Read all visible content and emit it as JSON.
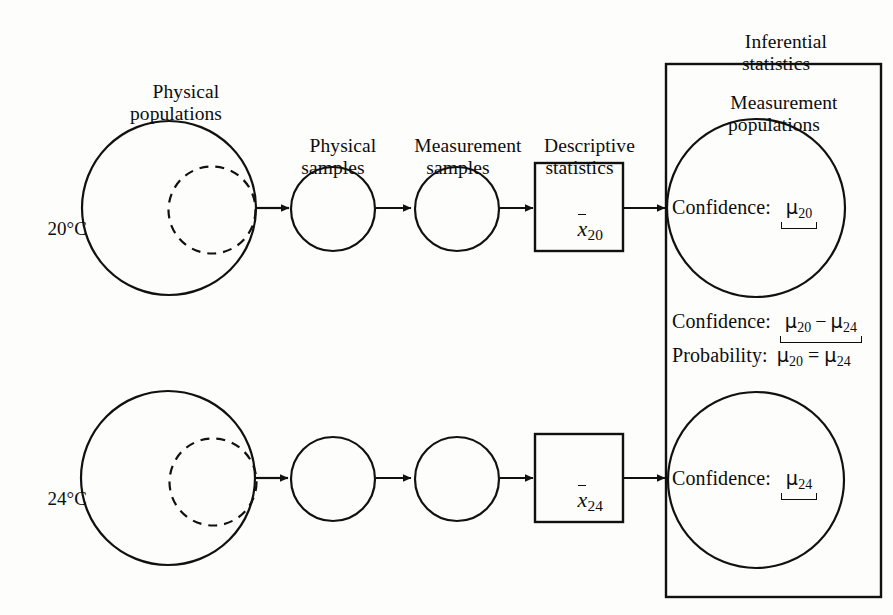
{
  "diagram": {
    "stroke_color": "#111111",
    "background_color": "#fdfdfb",
    "headings": {
      "physical_populations": "Physical\npopulations",
      "physical_samples": "Physical\nsamples",
      "measurement_samples": "Measurement\nsamples",
      "descriptive_statistics": "Descriptive\nstatistics",
      "inferential_statistics": "Inferential\nstatistics",
      "measurement_populations": "Measurement\npopulations"
    },
    "rows": [
      {
        "id": "row-20",
        "temperature_label": "20°C",
        "descriptive_statistic": {
          "symbol": "x",
          "bar": true,
          "subscript": "20"
        },
        "confidence": {
          "label": "Confidence:",
          "expression_mu": "μ",
          "expression_sub": "20"
        }
      },
      {
        "id": "row-24",
        "temperature_label": "24°C",
        "descriptive_statistic": {
          "symbol": "x",
          "bar": true,
          "subscript": "24"
        },
        "confidence": {
          "label": "Confidence:",
          "expression_mu": "μ",
          "expression_sub": "24"
        }
      }
    ],
    "comparisons": [
      {
        "id": "confidence-difference",
        "label": "Confidence:",
        "expr_a_mu": "μ",
        "expr_a_sub": "20",
        "operator": "−",
        "expr_b_mu": "μ",
        "expr_b_sub": "24",
        "braced": true
      },
      {
        "id": "probability-equality",
        "label": "Probability:",
        "expr_a_mu": "μ",
        "expr_a_sub": "20",
        "operator": "=",
        "expr_b_mu": "μ",
        "expr_b_sub": "24",
        "braced": false
      }
    ]
  }
}
